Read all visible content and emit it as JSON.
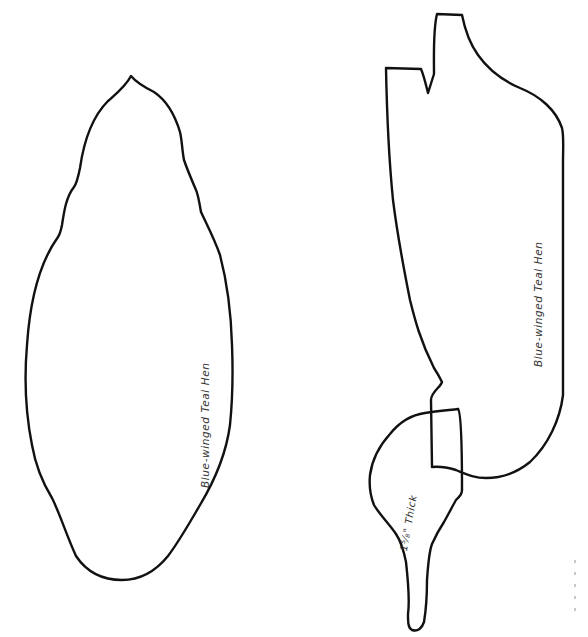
{
  "document": {
    "type": "carving pattern sheet",
    "background_color": "#ffffff",
    "line_color": "#111111",
    "text_color": "#333333"
  },
  "patterns": {
    "top_view": {
      "label": "Blue-winged Teal Hen"
    },
    "side_view": {
      "label": "Blue-winged Teal Hen",
      "head": {
        "thickness_label": "1⁵⁄₈\" Thick"
      }
    }
  }
}
